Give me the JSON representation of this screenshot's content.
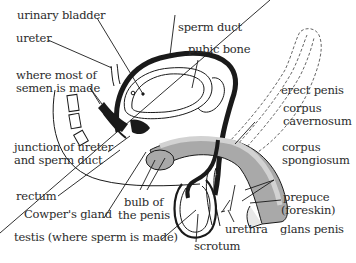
{
  "diagram": {
    "colors": {
      "ink": "#1a1a1a",
      "tissue_grey": "#a9a9a9",
      "light_grey": "#d2d2d2",
      "background": "#ffffff"
    },
    "labels": {
      "urinary_bladder": "urinary bladder",
      "ureter": "ureter",
      "where_semen_1": "where most of",
      "where_semen_2": "semen is made",
      "junction_1": "junction of ureter",
      "junction_2": "and sperm duct",
      "rectum": "rectum",
      "cowpers_gland": "Cowper's gland",
      "testis": "testis (where sperm is made)",
      "sperm_duct": "sperm duct",
      "pubic_bone": "pubic bone",
      "erect_penis": "erect penis",
      "corpus_cavernosum_1": "corpus",
      "corpus_cavernosum_2": "cavernosum",
      "corpus_spongiosum_1": "corpus",
      "corpus_spongiosum_2": "spongiosum",
      "prepuce_1": "prepuce",
      "prepuce_2": "(foreskin)",
      "bulb_1": "bulb of",
      "bulb_2": "the penis",
      "urethra": "urethra",
      "glans_penis": "glans penis",
      "scrotum": "scrotum"
    }
  }
}
